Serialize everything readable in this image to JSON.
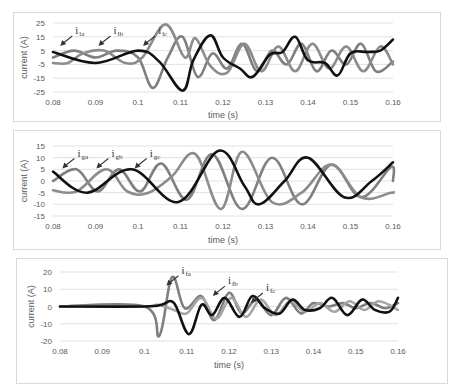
{
  "chart_data": [
    {
      "type": "line",
      "title": "",
      "xlabel": "time (s)",
      "ylabel": "current (A)",
      "xlim": [
        0.08,
        0.16
      ],
      "ylim": [
        -25,
        25
      ],
      "xticks": [
        "0.08",
        "0.09",
        "0.1",
        "0.11",
        "0.12",
        "0.13",
        "0.14",
        "0.15",
        "0.16"
      ],
      "yticks": [
        "25",
        "15",
        "5",
        "-5",
        "-15",
        "-25"
      ],
      "grid": true,
      "legend": "inline-annotations",
      "series": [
        {
          "name": "i_la",
          "label_main": "i",
          "label_sub": "la",
          "color": "#7f7f7f",
          "x": [
            0.08,
            0.085,
            0.09,
            0.095,
            0.1,
            0.1035,
            0.107,
            0.1105,
            0.114,
            0.1175,
            0.121,
            0.1245,
            0.128,
            0.1315,
            0.135,
            0.1385,
            0.142,
            0.1455,
            0.149,
            0.1525,
            0.156,
            0.16
          ],
          "y": [
            0,
            5,
            0,
            5,
            0,
            -22,
            0,
            15,
            -14,
            3,
            -8,
            10,
            -10,
            5,
            -5,
            10,
            -10,
            5,
            -5,
            10,
            -10,
            -3
          ]
        },
        {
          "name": "i_lb",
          "label_main": "i",
          "label_sub": "lb",
          "color": "#8c8c8c",
          "x": [
            0.08,
            0.0835,
            0.087,
            0.092,
            0.097,
            0.101,
            0.1065,
            0.111,
            0.1135,
            0.117,
            0.121,
            0.125,
            0.129,
            0.133,
            0.137,
            0.141,
            0.145,
            0.149,
            0.153,
            0.157,
            0.16
          ],
          "y": [
            -4,
            -4,
            3,
            5,
            -4,
            0,
            24,
            0,
            14,
            -6,
            -11,
            10,
            -10,
            8,
            -10,
            10,
            -8,
            8,
            -10,
            8,
            -5
          ]
        },
        {
          "name": "i_lc",
          "label_main": "i",
          "label_sub": "lc",
          "color": "#111111",
          "x": [
            0.08,
            0.09,
            0.1,
            0.105,
            0.1105,
            0.113,
            0.117,
            0.12,
            0.124,
            0.127,
            0.131,
            0.134,
            0.137,
            0.14,
            0.144,
            0.147,
            0.15,
            0.154,
            0.157,
            0.16
          ],
          "y": [
            4,
            -4,
            5,
            -3,
            -24,
            -2,
            16,
            0,
            -8,
            -14,
            2,
            4,
            15,
            -2,
            -4,
            -13,
            3,
            4,
            5,
            13
          ]
        }
      ],
      "annotations": [
        {
          "series": "i_la",
          "x": 0.085,
          "y": 17
        },
        {
          "series": "i_lb",
          "x": 0.094,
          "y": 17
        },
        {
          "series": "i_lc",
          "x": 0.1045,
          "y": 17
        }
      ]
    },
    {
      "type": "line",
      "title": "",
      "xlabel": "time (s)",
      "ylabel": "current (A)",
      "xlim": [
        0.08,
        0.16
      ],
      "ylim": [
        -15,
        15
      ],
      "xticks": [
        "0.08",
        "0.09",
        "0.1",
        "0.11",
        "0.12",
        "0.13",
        "0.14",
        "0.15",
        "0.16"
      ],
      "yticks": [
        "15",
        "10",
        "5",
        "0",
        "-5",
        "-10",
        "-15"
      ],
      "grid": true,
      "legend": "inline-annotations",
      "series": [
        {
          "name": "i_ga",
          "label_main": "i",
          "label_sub": "ga",
          "color": "#7f7f7f",
          "x": [
            0.08,
            0.0855,
            0.0905,
            0.0955,
            0.1005,
            0.1055,
            0.1115,
            0.1175,
            0.1245,
            0.1315,
            0.1385,
            0.1455,
            0.1525,
            0.1595,
            0.16
          ],
          "y": [
            0,
            5,
            -4.5,
            5,
            -4.5,
            7.5,
            -8,
            11.5,
            -12,
            10,
            -10,
            7,
            -7,
            6,
            0
          ]
        },
        {
          "name": "i_gb",
          "label_main": "i",
          "label_sub": "gb",
          "color": "#8c8c8c",
          "x": [
            0.08,
            0.0855,
            0.0925,
            0.0975,
            0.1025,
            0.108,
            0.1135,
            0.1195,
            0.1245,
            0.1315,
            0.1385,
            0.1455,
            0.1525,
            0.1595,
            0.16
          ],
          "y": [
            -4,
            -4.5,
            5,
            -4.5,
            -5,
            2,
            11.5,
            -12,
            12.5,
            -9,
            -5,
            7,
            -7,
            -5,
            -5
          ]
        },
        {
          "name": "i_gc",
          "label_main": "i",
          "label_sub": "gc",
          "color": "#111111",
          "x": [
            0.08,
            0.088,
            0.0985,
            0.1095,
            0.119,
            0.125,
            0.1285,
            0.1345,
            0.14,
            0.1485,
            0.155,
            0.16
          ],
          "y": [
            4,
            -5,
            5,
            -9,
            13,
            -2,
            -10,
            0,
            10,
            -7,
            0,
            8
          ]
        }
      ],
      "annotations": [
        {
          "series": "i_ga",
          "x": 0.0855,
          "y": 10.5
        },
        {
          "series": "i_gb",
          "x": 0.0935,
          "y": 10.5
        },
        {
          "series": "i_gc",
          "x": 0.1025,
          "y": 10.5
        }
      ]
    },
    {
      "type": "line",
      "title": "",
      "xlabel": "time (s)",
      "ylabel": "current (A)",
      "xlim": [
        0.08,
        0.16
      ],
      "ylim": [
        -20,
        20
      ],
      "xticks": [
        "0.08",
        "0.09",
        "0.1",
        "0.11",
        "0.12",
        "0.13",
        "0.14",
        "0.15",
        "0.16"
      ],
      "yticks": [
        "20",
        "10",
        "0",
        "-10",
        "-20"
      ],
      "grid": true,
      "legend": "inline-annotations",
      "series": [
        {
          "name": "i_fa",
          "label_main": "i",
          "label_sub": "fa",
          "color": "#7f7f7f",
          "x": [
            0.08,
            0.1,
            0.1035,
            0.1065,
            0.1095,
            0.1135,
            0.1165,
            0.12,
            0.123,
            0.1265,
            0.13,
            0.1335,
            0.137,
            0.14,
            0.1435,
            0.147,
            0.15,
            0.1535,
            0.157,
            0.16
          ],
          "y": [
            0,
            0,
            -17,
            17,
            -1,
            6,
            -8,
            8,
            -4,
            4,
            -5,
            5,
            -4,
            2,
            0,
            2,
            -1,
            2,
            -1,
            2
          ]
        },
        {
          "name": "i_fb",
          "label_main": "i",
          "label_sub": "fb",
          "color": "#a6a6a6",
          "x": [
            0.08,
            0.1,
            0.103,
            0.107,
            0.11,
            0.1135,
            0.117,
            0.1205,
            0.124,
            0.1275,
            0.131,
            0.1345,
            0.138,
            0.1415,
            0.145,
            0.1485,
            0.152,
            0.1555,
            0.16
          ],
          "y": [
            0,
            0,
            1,
            -2,
            -4,
            5,
            -7,
            5,
            -6,
            4,
            -5,
            3,
            -3,
            2,
            -3,
            3,
            -2,
            3,
            -2
          ]
        },
        {
          "name": "i_fc",
          "label_main": "i",
          "label_sub": "fc",
          "color": "#111111",
          "x": [
            0.08,
            0.1,
            0.104,
            0.107,
            0.1105,
            0.1135,
            0.116,
            0.119,
            0.1225,
            0.1255,
            0.1285,
            0.132,
            0.135,
            0.138,
            0.1415,
            0.1445,
            0.148,
            0.1515,
            0.1545,
            0.158,
            0.16
          ],
          "y": [
            0,
            0,
            1,
            2,
            -16,
            1,
            -5,
            5,
            -6,
            6,
            -1,
            -4,
            4,
            -2,
            -1,
            5,
            -5,
            4,
            -2,
            -3,
            5
          ]
        }
      ],
      "annotations": [
        {
          "series": "i_fa",
          "x": 0.1085,
          "y": 19
        },
        {
          "series": "i_fb",
          "x": 0.1195,
          "y": 13
        },
        {
          "series": "i_fc",
          "x": 0.1285,
          "y": 9
        }
      ]
    }
  ],
  "panels": [
    {
      "left": 13,
      "top": 12,
      "width": 428,
      "height": 110,
      "plot": {
        "x0": 53,
        "x1": 393,
        "y0": 23,
        "y1": 92
      },
      "xtick_y": 105,
      "xtitle_y": 118,
      "ytitle_x": 27
    },
    {
      "left": 13,
      "top": 130,
      "width": 428,
      "height": 120,
      "plot": {
        "x0": 53,
        "x1": 393,
        "y0": 146,
        "y1": 216
      },
      "xtick_y": 229,
      "xtitle_y": 243,
      "ytitle_x": 27
    },
    {
      "left": 16,
      "top": 258,
      "width": 432,
      "height": 126,
      "plot": {
        "x0": 60,
        "x1": 398,
        "y0": 272,
        "y1": 341
      },
      "xtick_y": 354,
      "xtitle_y": 368,
      "ytitle_x": 34
    }
  ]
}
